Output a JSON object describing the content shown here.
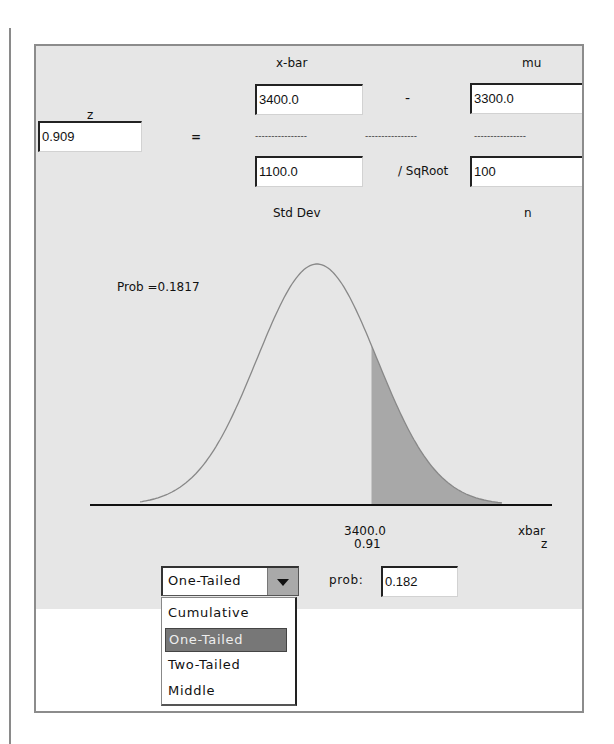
{
  "formula": {
    "z_label": "z",
    "z_value": "0.909",
    "equals": "=",
    "xbar_label": "x-bar",
    "xbar_value": "3400.0",
    "minus": "-",
    "mu_label": "mu",
    "mu_value": "3300.0",
    "divider": "----------------",
    "std_value": "1100.0",
    "sqroot_label": "/ SqRoot",
    "n_value": "100",
    "std_label": "Std Dev",
    "n_label": "n"
  },
  "plot": {
    "prob_text": "Prob =0.1817",
    "xbar_tick": "3400.0",
    "z_tick": "0.91",
    "xbar_axis": "xbar",
    "z_axis": "z",
    "curve_color": "#888888",
    "shade_color": "#a8a8a8"
  },
  "controls": {
    "tail_type_selected": "One-Tailed",
    "prob_label": "prob:",
    "prob_value": "0.182",
    "tail_options": [
      "Cumulative",
      "One-Tailed",
      "Two-Tailed",
      "Middle"
    ]
  },
  "chart_data": {
    "type": "area",
    "title": "Prob =0.1817",
    "distribution": "normal",
    "mean": 3300.0,
    "std_error": 110.0,
    "shaded_from_x": 3400.0,
    "shaded_from_z": 0.91,
    "shaded_region": "right tail",
    "probability": 0.1817,
    "xlabel": "xbar / z",
    "tick_labels": [
      "3400.0",
      "0.91"
    ]
  }
}
